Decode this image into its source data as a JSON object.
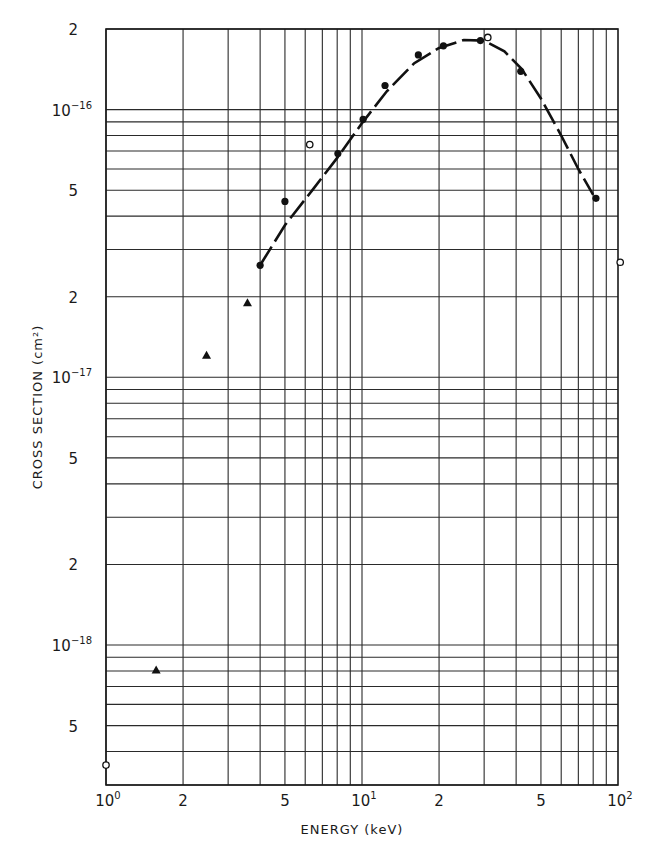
{
  "chart_data": {
    "type": "scatter",
    "title": "",
    "xlabel": "ENERGY (keV)",
    "ylabel": "CROSS SECTION (cm²)",
    "xscale": "log",
    "yscale": "log",
    "xlim": [
      1,
      100
    ],
    "ylim": [
      3e-19,
      2e-16
    ],
    "grid": true,
    "x_tick_labels": [
      {
        "value": 1,
        "base": "10",
        "exp": "0"
      },
      {
        "value": 2,
        "base": "2",
        "exp": ""
      },
      {
        "value": 5,
        "base": "5",
        "exp": ""
      },
      {
        "value": 10,
        "base": "10",
        "exp": "1"
      },
      {
        "value": 20,
        "base": "2",
        "exp": ""
      },
      {
        "value": 50,
        "base": "5",
        "exp": ""
      },
      {
        "value": 100,
        "base": "10",
        "exp": "2"
      }
    ],
    "y_tick_labels": [
      {
        "value": 2e-16,
        "base": "2",
        "exp": ""
      },
      {
        "value": 1e-16,
        "base": "10",
        "exp": "−16"
      },
      {
        "value": 5e-17,
        "base": "5",
        "exp": ""
      },
      {
        "value": 2e-17,
        "base": "2",
        "exp": ""
      },
      {
        "value": 1e-17,
        "base": "10",
        "exp": "−17"
      },
      {
        "value": 5e-18,
        "base": "5",
        "exp": ""
      },
      {
        "value": 2e-18,
        "base": "2",
        "exp": ""
      },
      {
        "value": 1e-18,
        "base": "10",
        "exp": "−18"
      },
      {
        "value": 5e-19,
        "base": "5",
        "exp": ""
      }
    ],
    "series": [
      {
        "name": "filled circles",
        "marker": "filled-circle",
        "x": [
          4.0,
          5.0,
          8.05,
          10.1,
          12.3,
          16.6,
          20.8,
          29.0,
          41.7,
          82.0
        ],
        "y": [
          2.62e-17,
          4.54e-17,
          6.85e-17,
          9.2e-17,
          1.23e-16,
          1.6e-16,
          1.73e-16,
          1.81e-16,
          1.39e-16,
          4.66e-17
        ]
      },
      {
        "name": "open circles",
        "marker": "open-circle",
        "x": [
          1.0,
          6.25,
          31.0,
          102.0
        ],
        "y": [
          3.56e-19,
          7.4e-17,
          1.86e-16,
          2.69e-17
        ]
      },
      {
        "name": "triangles",
        "marker": "filled-triangle",
        "x": [
          1.57,
          2.47,
          3.57
        ],
        "y": [
          8.07e-19,
          1.21e-17,
          1.9e-17
        ]
      },
      {
        "name": "fitted curve",
        "marker": "dashed-line",
        "x": [
          4.0,
          5.0,
          6.5,
          8.0,
          10.0,
          12.5,
          16.0,
          20.0,
          25.0,
          30.0,
          36.0,
          42.0,
          50.0,
          60.0,
          70.0,
          80.0
        ],
        "y": [
          2.62e-17,
          3.7e-17,
          5.1e-17,
          6.6e-17,
          8.9e-17,
          1.17e-16,
          1.49e-16,
          1.7e-16,
          1.82e-16,
          1.81e-16,
          1.65e-16,
          1.42e-16,
          1.1e-16,
          8e-17,
          6e-17,
          4.8e-17
        ]
      }
    ]
  },
  "layout": {
    "plot_left": 106,
    "plot_right": 618,
    "plot_top": 29,
    "plot_bottom": 785
  }
}
